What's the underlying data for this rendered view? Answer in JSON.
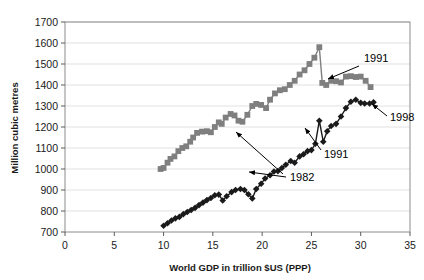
{
  "chart_data": {
    "type": "scatter",
    "title": "",
    "xlabel": "World GDP in trillion $US (PPP)",
    "ylabel": "Million cubic metres",
    "xlim": [
      0,
      35
    ],
    "ylim": [
      700,
      1700
    ],
    "xticks": [
      0,
      5,
      10,
      15,
      20,
      25,
      30,
      35
    ],
    "yticks": [
      700,
      800,
      900,
      1000,
      1100,
      1200,
      1300,
      1400,
      1500,
      1600,
      1700
    ],
    "grid": "horizontal",
    "legend_position": "none",
    "series": [
      {
        "name": "upper-series",
        "marker": "square",
        "color": "#7f7f7f",
        "points": [
          [
            9.7,
            1000
          ],
          [
            10.0,
            1005
          ],
          [
            10.4,
            1030
          ],
          [
            10.7,
            1048
          ],
          [
            11.1,
            1060
          ],
          [
            11.5,
            1085
          ],
          [
            11.9,
            1100
          ],
          [
            12.3,
            1108
          ],
          [
            12.7,
            1130
          ],
          [
            13.0,
            1150
          ],
          [
            13.4,
            1172
          ],
          [
            13.9,
            1178
          ],
          [
            14.4,
            1180
          ],
          [
            14.8,
            1175
          ],
          [
            15.2,
            1200
          ],
          [
            15.6,
            1222
          ],
          [
            15.9,
            1215
          ],
          [
            16.3,
            1245
          ],
          [
            16.8,
            1262
          ],
          [
            17.2,
            1255
          ],
          [
            17.6,
            1230
          ],
          [
            18.0,
            1225
          ],
          [
            18.5,
            1258
          ],
          [
            19.0,
            1300
          ],
          [
            19.4,
            1310
          ],
          [
            19.9,
            1305
          ],
          [
            20.4,
            1290
          ],
          [
            20.8,
            1330
          ],
          [
            21.3,
            1360
          ],
          [
            21.8,
            1375
          ],
          [
            22.3,
            1380
          ],
          [
            22.8,
            1400
          ],
          [
            23.3,
            1420
          ],
          [
            23.8,
            1450
          ],
          [
            24.3,
            1470
          ],
          [
            24.8,
            1500
          ],
          [
            25.3,
            1530
          ],
          [
            25.8,
            1580
          ],
          [
            26.1,
            1410
          ],
          [
            26.5,
            1400
          ],
          [
            27.0,
            1420
          ],
          [
            27.5,
            1418
          ],
          [
            28.0,
            1412
          ],
          [
            28.5,
            1440
          ],
          [
            29.0,
            1442
          ],
          [
            29.5,
            1438
          ],
          [
            30.0,
            1440
          ],
          [
            30.5,
            1420
          ],
          [
            31.0,
            1390
          ]
        ]
      },
      {
        "name": "lower-series",
        "marker": "diamond",
        "color": "#1a1a1a",
        "points": [
          [
            10.0,
            730
          ],
          [
            10.4,
            742
          ],
          [
            10.8,
            755
          ],
          [
            11.2,
            765
          ],
          [
            11.6,
            772
          ],
          [
            12.0,
            785
          ],
          [
            12.4,
            795
          ],
          [
            12.8,
            805
          ],
          [
            13.2,
            815
          ],
          [
            13.6,
            828
          ],
          [
            14.0,
            840
          ],
          [
            14.4,
            852
          ],
          [
            14.8,
            862
          ],
          [
            15.2,
            875
          ],
          [
            15.6,
            878
          ],
          [
            16.0,
            850
          ],
          [
            16.4,
            870
          ],
          [
            16.9,
            890
          ],
          [
            17.3,
            900
          ],
          [
            17.8,
            905
          ],
          [
            18.2,
            900
          ],
          [
            18.6,
            880
          ],
          [
            19.0,
            860
          ],
          [
            19.4,
            905
          ],
          [
            19.9,
            930
          ],
          [
            20.3,
            955
          ],
          [
            20.8,
            970
          ],
          [
            21.2,
            988
          ],
          [
            21.6,
            990
          ],
          [
            22.0,
            1005
          ],
          [
            22.4,
            1020
          ],
          [
            22.9,
            1038
          ],
          [
            23.3,
            1030
          ],
          [
            23.8,
            1060
          ],
          [
            24.2,
            1070
          ],
          [
            24.6,
            1085
          ],
          [
            25.0,
            1090
          ],
          [
            25.4,
            1120
          ],
          [
            25.8,
            1230
          ],
          [
            26.2,
            1130
          ],
          [
            26.6,
            1180
          ],
          [
            27.0,
            1205
          ],
          [
            27.5,
            1215
          ],
          [
            28.0,
            1250
          ],
          [
            28.5,
            1290
          ],
          [
            29.0,
            1320
          ],
          [
            29.5,
            1330
          ],
          [
            30.0,
            1315
          ],
          [
            30.4,
            1312
          ],
          [
            30.9,
            1312
          ],
          [
            31.3,
            1318
          ]
        ]
      }
    ],
    "annotations": [
      {
        "label": "1991",
        "text_x": 364,
        "text_y": 62,
        "arrow_from_x": 359,
        "arrow_from_y": 66,
        "arrow_to_x": 328,
        "arrow_to_y": 79
      },
      {
        "label": "1998",
        "text_x": 390,
        "text_y": 121,
        "arrow_from_x": 387,
        "arrow_from_y": 116,
        "arrow_to_x": 372,
        "arrow_to_y": 104
      },
      {
        "label": "1991",
        "text_x": 324,
        "text_y": 158,
        "arrow_from_x": 321,
        "arrow_from_y": 150,
        "arrow_to_x": 305,
        "arrow_to_y": 128
      },
      {
        "label": "1982",
        "text_x": 290,
        "text_y": 181,
        "arrow_from_x": 286,
        "arrow_from_y": 177,
        "arrow_to_x": 249,
        "arrow_to_y": 172
      },
      {
        "label": "",
        "text_x": 0,
        "text_y": 0,
        "arrow_from_x": 283,
        "arrow_from_y": 174,
        "arrow_to_x": 236,
        "arrow_to_y": 132
      }
    ]
  }
}
